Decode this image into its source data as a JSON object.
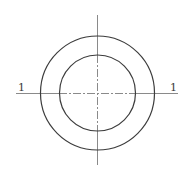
{
  "diagram": {
    "type": "engineering-drawing",
    "canvas": {
      "width": 193,
      "height": 179,
      "background": "#ffffff"
    },
    "center": {
      "x": 97,
      "y": 93
    },
    "outer_circle": {
      "r": 57,
      "stroke": "#3c3c3c"
    },
    "inner_circle": {
      "r": 38,
      "stroke": "#3c3c3c"
    },
    "center_lines": {
      "horizontal": {
        "x1": 16,
        "x2": 178,
        "y": 93
      },
      "vertical": {
        "x": 97,
        "y1": 15,
        "y2": 165
      },
      "stroke": "#8a8a8a"
    },
    "section_labels": {
      "left": "1",
      "right": "1"
    }
  }
}
